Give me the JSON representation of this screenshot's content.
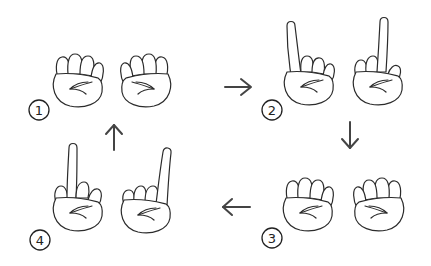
{
  "diagram": {
    "type": "finger-exercise-sequence",
    "colors": {
      "stroke": "#2b2b2b",
      "arrow": "#444444",
      "background": "#ffffff"
    },
    "steps": [
      {
        "number": "1",
        "left_hand": "fist",
        "right_hand": "fist"
      },
      {
        "number": "2",
        "left_hand": "index-finger-raised",
        "right_hand": "middle-finger-raised"
      },
      {
        "number": "3",
        "left_hand": "fist",
        "right_hand": "fist"
      },
      {
        "number": "4",
        "left_hand": "middle-finger-raised",
        "right_hand": "index-finger-raised"
      }
    ],
    "arrows": [
      {
        "from": "1",
        "to": "2",
        "direction": "right"
      },
      {
        "from": "2",
        "to": "3",
        "direction": "down"
      },
      {
        "from": "3",
        "to": "4",
        "direction": "left"
      },
      {
        "from": "4",
        "to": "1",
        "direction": "up"
      }
    ]
  }
}
